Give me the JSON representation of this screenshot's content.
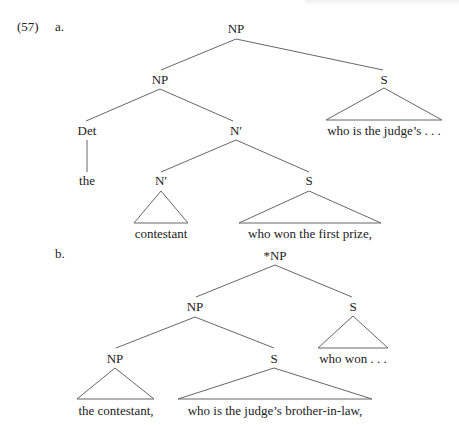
{
  "example": {
    "number": "(57)",
    "part_a_label": "a.",
    "part_b_label": "b."
  },
  "tree_a": {
    "root": "NP",
    "np": "NP",
    "s_right": "S",
    "s_right_text": "who is the judge’s . . .",
    "det": "Det",
    "det_word": "the",
    "nbar": "N′",
    "nbar_inner": "N′",
    "nbar_inner_text": "contestant",
    "s_inner": "S",
    "s_inner_text": "who won the first prize,"
  },
  "tree_b": {
    "root": "*NP",
    "np": "NP",
    "s_right": "S",
    "s_right_text": "who won . . .",
    "np_inner": "NP",
    "np_inner_text": "the contestant,",
    "s_inner": "S",
    "s_inner_text": "who is the judge’s brother-in-law,"
  },
  "colors": {
    "line": "#666666",
    "text": "#222222"
  }
}
